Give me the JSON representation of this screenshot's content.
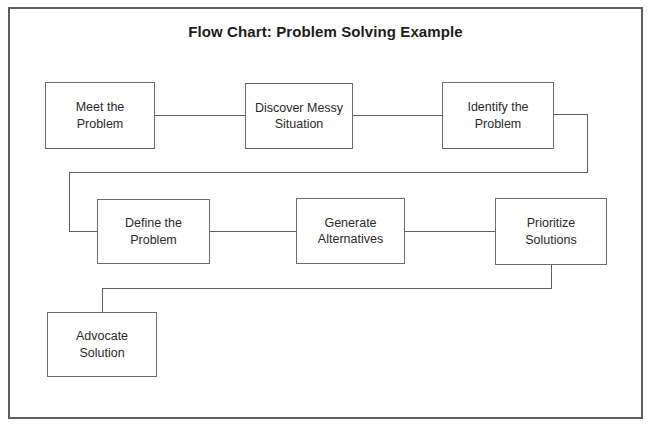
{
  "title": "Flow Chart: Problem Solving Example",
  "nodes": [
    {
      "id": "meet-the-problem",
      "lines": [
        "Meet the",
        "Problem"
      ]
    },
    {
      "id": "discover-messy-situation",
      "lines": [
        "Discover Messy",
        "Situation"
      ]
    },
    {
      "id": "identify-the-problem",
      "lines": [
        "Identify the",
        "Problem"
      ]
    },
    {
      "id": "define-the-problem",
      "lines": [
        "Define the",
        "Problem"
      ]
    },
    {
      "id": "generate-alternatives",
      "lines": [
        "Generate",
        "Alternatives"
      ]
    },
    {
      "id": "prioritize-solutions",
      "lines": [
        "Prioritize",
        "Solutions"
      ]
    },
    {
      "id": "advocate-solution",
      "lines": [
        "Advocate",
        "Solution"
      ]
    }
  ],
  "edges": [
    {
      "from": "meet-the-problem",
      "to": "discover-messy-situation"
    },
    {
      "from": "discover-messy-situation",
      "to": "identify-the-problem"
    },
    {
      "from": "identify-the-problem",
      "to": "define-the-problem"
    },
    {
      "from": "define-the-problem",
      "to": "generate-alternatives"
    },
    {
      "from": "generate-alternatives",
      "to": "prioritize-solutions"
    },
    {
      "from": "prioritize-solutions",
      "to": "advocate-solution"
    }
  ],
  "colors": {
    "frame_border": "#5d5d5d",
    "box_border": "#6b6b6b",
    "connector": "#5f5f5f",
    "text": "#2a2a2a",
    "title_text": "#1c1c1c",
    "background": "#ffffff"
  }
}
